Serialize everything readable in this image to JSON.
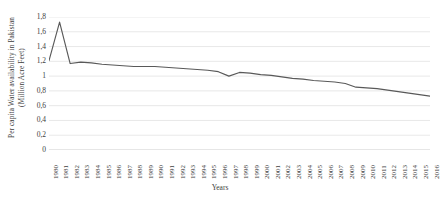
{
  "chart_data": {
    "type": "line",
    "title": "",
    "xlabel": "Years",
    "ylabel": "Per capita Water availability in Pakistan (Million Acre Feet)",
    "ylabel_line1": "Per capita Water availability  in  Pakistan",
    "ylabel_line2": "(Million  Acre Feet)",
    "ylim": [
      0,
      1.8
    ],
    "ytick_step": 0.2,
    "yticks": [
      "0",
      "0,2",
      "0,4",
      "0,6",
      "0,8",
      "1",
      "1,2",
      "1,4",
      "1,6",
      "1,8"
    ],
    "ytick_values": [
      0,
      0.2,
      0.4,
      0.6,
      0.8,
      1.0,
      1.2,
      1.4,
      1.6,
      1.8
    ],
    "grid": true,
    "grid_axis": "y",
    "legend": false,
    "legend_position": "none",
    "categories": [
      "1980",
      "1981",
      "1982",
      "1983",
      "1984",
      "1985",
      "1986",
      "1987",
      "1988",
      "1989",
      "1990",
      "1991",
      "1992",
      "1993",
      "1994",
      "1995",
      "1996",
      "1997",
      "1998",
      "1999",
      "2000",
      "2001",
      "2002",
      "2003",
      "2004",
      "2005",
      "2006",
      "2007",
      "2008",
      "2009",
      "2010",
      "2011",
      "2012",
      "2013",
      "2014",
      "2015",
      "2016"
    ],
    "values": [
      1.21,
      1.73,
      1.17,
      1.19,
      1.18,
      1.16,
      1.15,
      1.14,
      1.13,
      1.13,
      1.13,
      1.12,
      1.11,
      1.1,
      1.09,
      1.08,
      1.06,
      1.0,
      1.05,
      1.04,
      1.02,
      1.01,
      0.99,
      0.97,
      0.96,
      0.94,
      0.93,
      0.92,
      0.9,
      0.85,
      0.84,
      0.83,
      0.81,
      0.79,
      0.77,
      0.75,
      0.73
    ],
    "series": [
      {
        "name": "Per capita water availability",
        "color": "#595959",
        "values": [
          1.21,
          1.73,
          1.17,
          1.19,
          1.18,
          1.16,
          1.15,
          1.14,
          1.13,
          1.13,
          1.13,
          1.12,
          1.11,
          1.1,
          1.09,
          1.08,
          1.06,
          1.0,
          1.05,
          1.04,
          1.02,
          1.01,
          0.99,
          0.97,
          0.96,
          0.94,
          0.93,
          0.92,
          0.9,
          0.85,
          0.84,
          0.83,
          0.81,
          0.79,
          0.77,
          0.75,
          0.73
        ]
      }
    ],
    "colors": {
      "line": "#595959",
      "grid": "#d9d9d9",
      "axis": "#bfbfbf",
      "text": "#404040",
      "background": "#ffffff"
    }
  }
}
